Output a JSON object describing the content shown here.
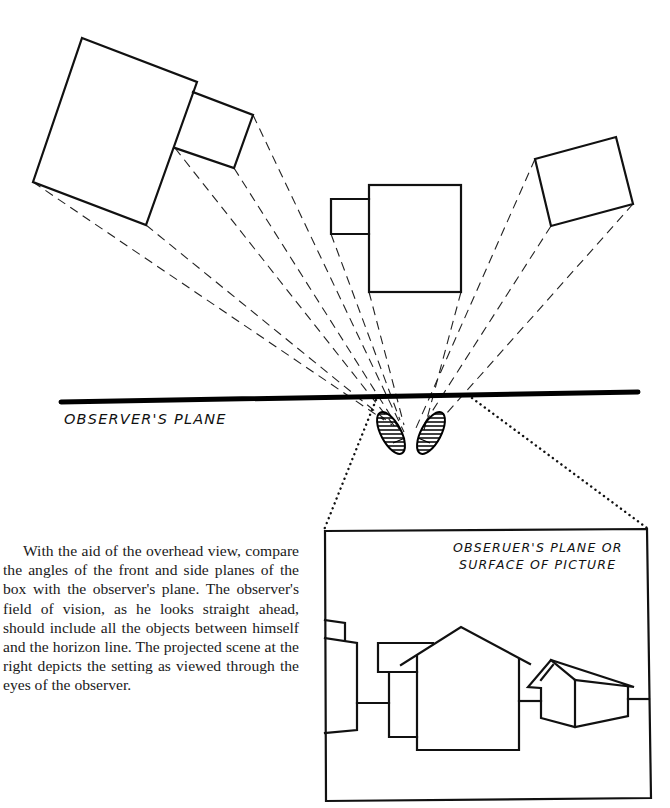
{
  "figure": {
    "labels": {
      "observers_plane": "OBSERVER'S PLANE",
      "picture_plane_line1": "OBSERUER'S PLANE OR",
      "picture_plane_line2": "SURFACE OF PICTURE"
    },
    "overhead_view": {
      "objects": [
        "large box with annex (left)",
        "box with annex (center)",
        "tilted box (right)"
      ],
      "observer": "pair of footprints"
    },
    "projected_scene": {
      "objects": [
        "left building",
        "back building",
        "main house",
        "right house"
      ],
      "horizon": "horizon line"
    }
  },
  "caption": {
    "text": "With the aid of the overhead view, compare the angles of the front and side planes of the box with the observer's plane. The observer's field of vision, as he looks straight ahead, should include all the objects between himself and the horizon line. The projected scene at the right depicts the setting as viewed through the eyes of the observer."
  }
}
